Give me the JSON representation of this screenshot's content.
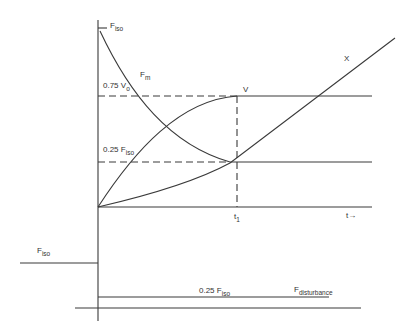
{
  "diagram": {
    "colors": {
      "line": "#3a3a3a",
      "background": "#ffffff"
    },
    "labels": {
      "f_iso_top": {
        "main": "F",
        "sub": "iso"
      },
      "f_m": {
        "main": "F",
        "sub": "m"
      },
      "v0_level": {
        "main": "0.75 V",
        "sub": "o"
      },
      "v": "V",
      "x": "X",
      "f_iso_quarter": {
        "main": "0.25 F",
        "sub": "iso"
      },
      "t1": {
        "main": "t",
        "sub": "1"
      },
      "t_axis": "t→",
      "f_iso_left": {
        "main": "F",
        "sub": "iso"
      },
      "f_iso_quarter_bottom": {
        "main": "0.25 F",
        "sub": "iso"
      },
      "f_disturbance": {
        "main": "F",
        "sub": "disturbance"
      }
    }
  }
}
